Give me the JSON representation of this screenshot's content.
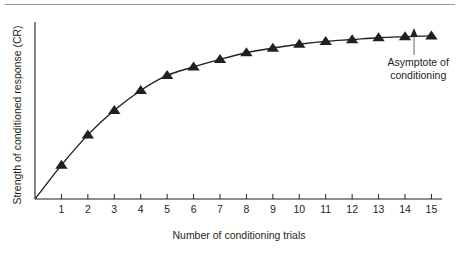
{
  "figure": {
    "name": "conditioning-learning-curve",
    "background_color": "#ffffff",
    "ink_color": "#231f20",
    "rule_color": "#9a9a9a"
  },
  "annotation": {
    "line1": "Asymptote of",
    "line2": "conditioning",
    "arrow": "up-arrow-icon",
    "points_to_trial": 14.5
  },
  "chart_data": {
    "type": "line",
    "title": "",
    "xlabel": "Number of conditioning trials",
    "ylabel": "Strength of conditioned response (CR)",
    "marker": "triangle-up",
    "grid": false,
    "legend": null,
    "xlim": [
      0,
      15.4
    ],
    "ylim": [
      0,
      1.06
    ],
    "x_tick_labels": [
      "1",
      "2",
      "3",
      "4",
      "5",
      "6",
      "7",
      "8",
      "9",
      "10",
      "11",
      "12",
      "13",
      "14",
      "15"
    ],
    "y_tick_labels": [],
    "x": [
      1,
      2,
      3,
      4,
      5,
      6,
      7,
      8,
      9,
      10,
      11,
      12,
      13,
      14,
      15
    ],
    "values": [
      0.203,
      0.384,
      0.531,
      0.65,
      0.74,
      0.791,
      0.836,
      0.876,
      0.904,
      0.927,
      0.944,
      0.955,
      0.966,
      0.972,
      0.977
    ],
    "annotations": [
      {
        "text": "Asymptote of conditioning",
        "x": 14.5,
        "y": 0.97
      }
    ]
  }
}
